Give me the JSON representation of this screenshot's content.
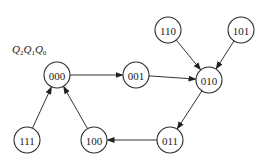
{
  "diagram": {
    "title_label": {
      "parts": [
        {
          "var": "Q",
          "sub": "2"
        },
        {
          "var": "Q",
          "sub": "1"
        },
        {
          "var": "Q",
          "sub": "0"
        }
      ]
    },
    "nodes": [
      {
        "id": "000",
        "label": "000"
      },
      {
        "id": "001",
        "label": "001"
      },
      {
        "id": "010",
        "label": "010"
      },
      {
        "id": "110",
        "label": "110"
      },
      {
        "id": "101",
        "label": "101"
      },
      {
        "id": "111",
        "label": "111"
      },
      {
        "id": "100",
        "label": "100"
      },
      {
        "id": "011",
        "label": "011"
      }
    ],
    "edges": [
      {
        "from": "000",
        "to": "001"
      },
      {
        "from": "001",
        "to": "010"
      },
      {
        "from": "110",
        "to": "010"
      },
      {
        "from": "101",
        "to": "010"
      },
      {
        "from": "010",
        "to": "011"
      },
      {
        "from": "011",
        "to": "100"
      },
      {
        "from": "100",
        "to": "000"
      },
      {
        "from": "111",
        "to": "000"
      }
    ],
    "colors": {
      "stroke": "#2a2a2a",
      "background": "#ffffff"
    }
  }
}
